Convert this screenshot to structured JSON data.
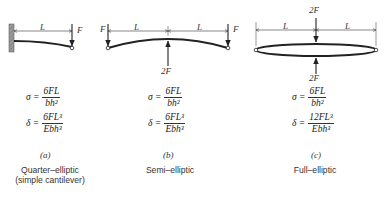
{
  "diagrams": [
    {
      "id": "a",
      "load_label": "F",
      "span_labels": [
        "L"
      ],
      "stress": {
        "lhs": "σ =",
        "numerator": "6FL",
        "denominator": "bh²"
      },
      "deflection": {
        "lhs": "δ =",
        "numerator": "6FL³",
        "denominator": "Ebh³"
      },
      "sublabel": "(a)",
      "caption_line1": "Quarter–elliptic",
      "caption_line2": "(simple cantilever)"
    },
    {
      "id": "b",
      "end_load_left": "F",
      "end_load_right": "F",
      "center_load": "2F",
      "span_labels": [
        "L",
        "L"
      ],
      "stress": {
        "lhs": "σ =",
        "numerator": "6FL",
        "denominator": "bh²"
      },
      "deflection": {
        "lhs": "δ =",
        "numerator": "6FL³",
        "denominator": "Ebh³"
      },
      "sublabel": "(b)",
      "caption_line1": "Semi–elliptic"
    },
    {
      "id": "c",
      "top_load": "2F",
      "bottom_load": "2F",
      "span_labels": [
        "L",
        "L"
      ],
      "stress": {
        "lhs": "σ =",
        "numerator": "6FL",
        "denominator": "bh²"
      },
      "deflection": {
        "lhs": "δ =",
        "numerator": "12FL³",
        "denominator": "Ebh³"
      },
      "sublabel": "(c)",
      "caption_line1": "Full–elliptic"
    }
  ]
}
